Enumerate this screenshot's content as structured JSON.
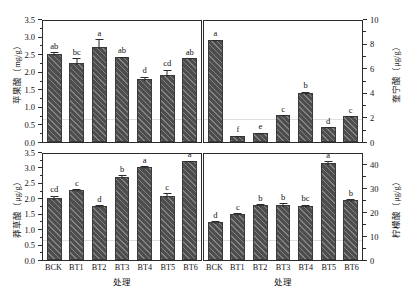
{
  "figure": {
    "xaxis_title": "处理",
    "panels": [
      {
        "id": "malic-acid",
        "ylabel": "苹果酸（mg/g）",
        "ylabel_text": "苹果酸",
        "ylabel_unit": "(mg/g)",
        "yticks": [
          "0.0",
          "0.5",
          "1.0",
          "1.5",
          "2.0",
          "2.5",
          "3.0",
          "3.5"
        ],
        "ymin": 0.0,
        "ymax": 3.5,
        "categories": [
          "BCK",
          "BT1",
          "BT2",
          "BT3",
          "BT4",
          "BT5",
          "BT6"
        ],
        "values": [
          2.45,
          2.2,
          2.65,
          2.35,
          1.74,
          1.84,
          2.32
        ],
        "errors": [
          0.1,
          0.18,
          0.28,
          0.07,
          0.12,
          0.22,
          0.07
        ],
        "letters": [
          "ab",
          "bc",
          "a",
          "ab",
          "d",
          "cd",
          "ab"
        ]
      },
      {
        "id": "quinic-acid",
        "ylabel": "奎宁酸（μg/g）",
        "ylabel_text": "奎宁酸",
        "ylabel_unit": "(μg/g)",
        "yticks": [
          "0",
          "2",
          "4",
          "6",
          "8",
          "10"
        ],
        "ymin": 0,
        "ymax": 10,
        "categories": [
          "BCK",
          "BT1",
          "BT2",
          "BT3",
          "BT4",
          "BT5",
          "BT6"
        ],
        "values": [
          8.15,
          0.35,
          0.6,
          2.0,
          3.8,
          1.05,
          1.95
        ],
        "errors": [
          0.18,
          0.05,
          0.08,
          0.15,
          0.28,
          0.1,
          0.15
        ],
        "letters": [
          "a",
          "f",
          "e",
          "c",
          "b",
          "d",
          "c"
        ]
      },
      {
        "id": "shikimic-acid",
        "ylabel": "莽草酸（μg/g）",
        "ylabel_text": "莽草酸",
        "ylabel_unit": "(μg/g)",
        "yticks": [
          "0.0",
          "0.5",
          "1.0",
          "1.5",
          "2.0",
          "2.5",
          "3.0",
          "3.5"
        ],
        "ymin": 0.0,
        "ymax": 3.5,
        "categories": [
          "BCK",
          "BT1",
          "BT2",
          "BT3",
          "BT4",
          "BT5",
          "BT6"
        ],
        "values": [
          1.95,
          2.2,
          1.7,
          2.63,
          2.94,
          2.02,
          3.13
        ],
        "errors": [
          0.13,
          0.1,
          0.08,
          0.12,
          0.1,
          0.15,
          0.08
        ],
        "letters": [
          "cd",
          "c",
          "d",
          "b",
          "a",
          "c",
          "a"
        ]
      },
      {
        "id": "citric-acid",
        "ylabel": "柠檬酸（μg/g）",
        "ylabel_text": "柠檬酸",
        "ylabel_unit": "(μg/g)",
        "yticks": [
          "0",
          "10",
          "20",
          "30",
          "40"
        ],
        "ymin": 0,
        "ymax": 45,
        "categories": [
          "BCK",
          "BT1",
          "BT2",
          "BT3",
          "BT4",
          "BT5",
          "BT6"
        ],
        "values": [
          15.0,
          18.5,
          22.0,
          22.2,
          21.6,
          39.5,
          24.0
        ],
        "errors": [
          1.2,
          1.0,
          1.3,
          1.5,
          1.4,
          1.6,
          1.3
        ],
        "letters": [
          "d",
          "c",
          "b",
          "b",
          "bc",
          "a",
          "b"
        ]
      }
    ],
    "style": {
      "bar_color": "#4d4d4d",
      "bar_edge_color": "#3a3a3a",
      "axis_color": "#2b2b2b",
      "background": "#ffffff"
    }
  },
  "chart_data": {
    "type": "bar",
    "title": "",
    "xlabel": "处理",
    "grid": false,
    "legend": "none",
    "panels": [
      {
        "name": "苹果酸 (mg/g)",
        "position": "top-left",
        "ylabel": "苹果酸（mg/g）",
        "ylim": [
          0.0,
          3.5
        ],
        "yticks": [
          0.0,
          0.5,
          1.0,
          1.5,
          2.0,
          2.5,
          3.0,
          3.5
        ],
        "categories": [
          "BCK",
          "BT1",
          "BT2",
          "BT3",
          "BT4",
          "BT5",
          "BT6"
        ],
        "values": [
          2.45,
          2.2,
          2.65,
          2.35,
          1.74,
          1.84,
          2.32
        ],
        "errors": [
          0.1,
          0.18,
          0.28,
          0.07,
          0.12,
          0.22,
          0.07
        ],
        "annotations": [
          "ab",
          "bc",
          "a",
          "ab",
          "d",
          "cd",
          "ab"
        ]
      },
      {
        "name": "奎宁酸 (μg/g)",
        "position": "top-right",
        "ylabel": "奎宁酸（μg/g）",
        "ylim": [
          0,
          10
        ],
        "yticks": [
          0,
          2,
          4,
          6,
          8,
          10
        ],
        "categories": [
          "BCK",
          "BT1",
          "BT2",
          "BT3",
          "BT4",
          "BT5",
          "BT6"
        ],
        "values": [
          8.15,
          0.35,
          0.6,
          2.0,
          3.8,
          1.05,
          1.95
        ],
        "errors": [
          0.18,
          0.05,
          0.08,
          0.15,
          0.28,
          0.1,
          0.15
        ],
        "annotations": [
          "a",
          "f",
          "e",
          "c",
          "b",
          "d",
          "c"
        ]
      },
      {
        "name": "莽草酸 (μg/g)",
        "position": "bottom-left",
        "ylabel": "莽草酸（μg/g）",
        "ylim": [
          0.0,
          3.5
        ],
        "yticks": [
          0.0,
          0.5,
          1.0,
          1.5,
          2.0,
          2.5,
          3.0,
          3.5
        ],
        "categories": [
          "BCK",
          "BT1",
          "BT2",
          "BT3",
          "BT4",
          "BT5",
          "BT6"
        ],
        "values": [
          1.95,
          2.2,
          1.7,
          2.63,
          2.94,
          2.02,
          3.13
        ],
        "errors": [
          0.13,
          0.1,
          0.08,
          0.12,
          0.1,
          0.15,
          0.08
        ],
        "annotations": [
          "cd",
          "c",
          "d",
          "b",
          "a",
          "c",
          "a"
        ]
      },
      {
        "name": "柠檬酸 (μg/g)",
        "position": "bottom-right",
        "ylabel": "柠檬酸（μg/g）",
        "ylim": [
          0,
          45
        ],
        "yticks": [
          0,
          10,
          20,
          30,
          40
        ],
        "categories": [
          "BCK",
          "BT1",
          "BT2",
          "BT3",
          "BT4",
          "BT5",
          "BT6"
        ],
        "values": [
          15.0,
          18.5,
          22.0,
          22.2,
          21.6,
          39.5,
          24.0
        ],
        "errors": [
          1.2,
          1.0,
          1.3,
          1.5,
          1.4,
          1.6,
          1.3
        ],
        "annotations": [
          "d",
          "c",
          "b",
          "b",
          "bc",
          "a",
          "b"
        ]
      }
    ]
  }
}
